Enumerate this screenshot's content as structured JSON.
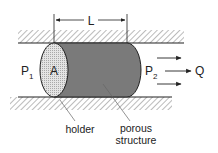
{
  "diagram": {
    "labels": {
      "length": "L",
      "area": "A",
      "p1_base": "P",
      "p1_sub": "1",
      "p2_base": "P",
      "p2_sub": "2",
      "flow": "Q",
      "holder": "holder",
      "porous_line1": "porous",
      "porous_line2": "structure"
    },
    "colors": {
      "line": "#222222",
      "porous_fill": "#7a7a7a",
      "holder_face": "#d8d8d8",
      "hatch": "#777777",
      "background": "#ffffff"
    }
  }
}
